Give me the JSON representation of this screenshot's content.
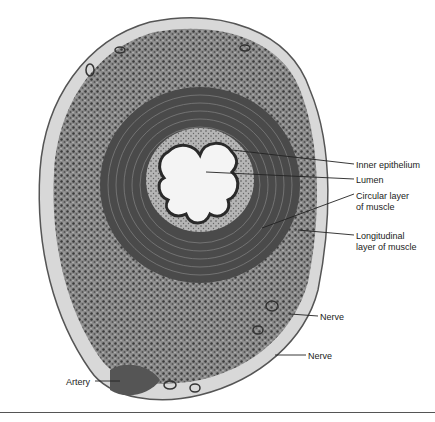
{
  "figure": {
    "labels": [
      {
        "id": "inner-epithelium",
        "text": "Inner epithelium",
        "x": 356,
        "y": 160
      },
      {
        "id": "lumen",
        "text": "Lumen",
        "x": 356,
        "y": 175
      },
      {
        "id": "circular-muscle",
        "text": "Circular layer",
        "x": 356,
        "y": 191
      },
      {
        "id": "circular-muscle-2",
        "text": "of muscle",
        "x": 356,
        "y": 202
      },
      {
        "id": "longitudinal-muscle",
        "text": "Longitudinal",
        "x": 356,
        "y": 231
      },
      {
        "id": "longitudinal-muscle-2",
        "text": "layer of muscle",
        "x": 356,
        "y": 242
      },
      {
        "id": "nerve-1",
        "text": "Nerve",
        "x": 320,
        "y": 312
      },
      {
        "id": "nerve-2",
        "text": "Nerve",
        "x": 308,
        "y": 351
      },
      {
        "id": "artery",
        "text": "Artery",
        "x": 66,
        "y": 377
      }
    ],
    "colors": {
      "tissue_dark": "#3a3a3a",
      "tissue_mid": "#7a7a7a",
      "tissue_light": "#c8c8c8",
      "lumen": "#f4f4f4",
      "label": "#222222"
    }
  }
}
